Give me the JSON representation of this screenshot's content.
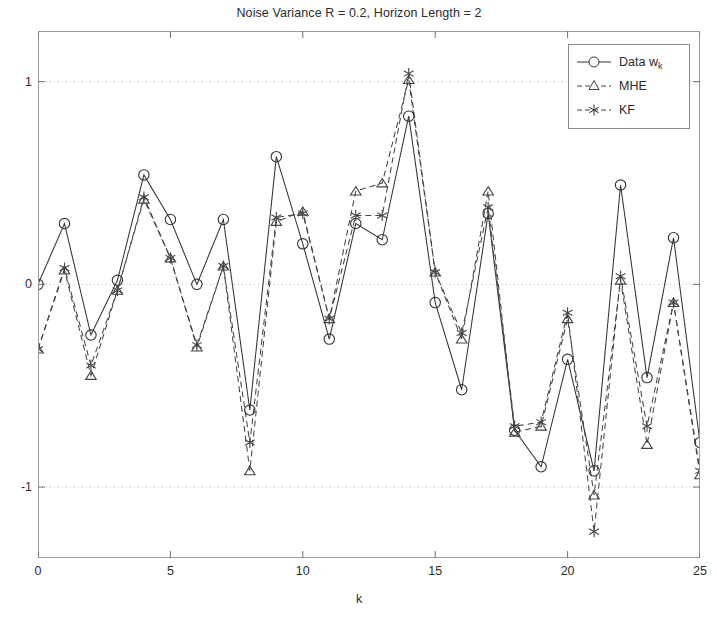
{
  "chart_data": {
    "type": "line",
    "title": "Noise Variance R = 0.2, Horizon Length = 2",
    "xlabel": "k",
    "ylabel": "",
    "xlim": [
      0,
      25
    ],
    "ylim": [
      -1.35,
      1.25
    ],
    "grid": true,
    "grid_style": "dotted-horizontal",
    "legend_position": "top-right",
    "xticks": [
      0,
      5,
      10,
      15,
      20,
      25
    ],
    "yticks": [
      1,
      0,
      -1
    ],
    "x": [
      0,
      1,
      2,
      3,
      4,
      5,
      6,
      7,
      8,
      9,
      10,
      11,
      12,
      13,
      14,
      15,
      16,
      17,
      18,
      19,
      20,
      21,
      22,
      23,
      24,
      25
    ],
    "series": [
      {
        "name": "Data w",
        "name_sub": "k",
        "marker": "circle",
        "line": "solid",
        "color": "#333333",
        "values": [
          0.0,
          0.3,
          -0.25,
          0.02,
          0.54,
          0.32,
          0.0,
          0.32,
          -0.62,
          0.63,
          0.2,
          -0.27,
          0.3,
          0.22,
          0.83,
          -0.09,
          -0.52,
          0.35,
          -0.72,
          -0.9,
          -0.37,
          -0.92,
          0.49,
          -0.46,
          0.23,
          -0.78
        ]
      },
      {
        "name": "MHE",
        "marker": "triangle",
        "line": "dashed",
        "color": "#444444",
        "values": [
          -0.32,
          0.07,
          -0.45,
          -0.03,
          0.42,
          0.13,
          -0.31,
          0.09,
          -0.92,
          0.31,
          0.36,
          -0.17,
          0.46,
          0.5,
          1.01,
          0.06,
          -0.27,
          0.46,
          -0.73,
          -0.7,
          -0.17,
          -1.04,
          0.02,
          -0.79,
          -0.09,
          -0.94
        ]
      },
      {
        "name": "KF",
        "marker": "asterisk",
        "line": "dashed",
        "color": "#444444",
        "values": [
          -0.32,
          0.08,
          -0.4,
          -0.03,
          0.43,
          0.13,
          -0.3,
          0.09,
          -0.78,
          0.33,
          0.35,
          -0.17,
          0.34,
          0.34,
          1.04,
          0.06,
          -0.24,
          0.38,
          -0.7,
          -0.68,
          -0.14,
          -1.22,
          0.04,
          -0.7,
          -0.09,
          -0.92
        ]
      }
    ]
  },
  "legend": {
    "items": [
      {
        "label": "Data w",
        "sub": "k",
        "marker": "circle",
        "line": "solid"
      },
      {
        "label": "MHE",
        "sub": "",
        "marker": "triangle",
        "line": "dashed"
      },
      {
        "label": "KF",
        "sub": "",
        "marker": "asterisk",
        "line": "dashed"
      }
    ]
  },
  "axes": {
    "y_tick_labels": [
      "1",
      "0",
      "-1"
    ],
    "x_tick_labels": [
      "0",
      "5",
      "10",
      "15",
      "20",
      "25"
    ],
    "x_axis_label": "k"
  }
}
